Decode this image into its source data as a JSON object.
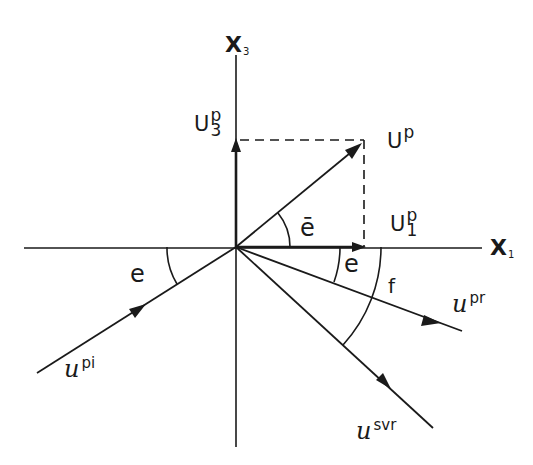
{
  "diagram": {
    "type": "vector-decomposition",
    "stroke_color": "#1a1a1a",
    "background": "#ffffff",
    "axes": {
      "horizontal": {
        "label": "X",
        "subscript": "1"
      },
      "vertical": {
        "label": "X",
        "subscript": "3"
      }
    },
    "vectors": {
      "up": {
        "label": "U",
        "superscript": "p"
      },
      "up1": {
        "label": "U",
        "superscript": "p",
        "subscript": "1"
      },
      "up3": {
        "label": "U",
        "superscript": "p",
        "subscript": "3"
      },
      "upi": {
        "label": "u",
        "superscript": "pi"
      },
      "upr": {
        "label": "u",
        "superscript": "pr"
      },
      "usvr": {
        "label": "u",
        "superscript": "svr"
      }
    },
    "angles": {
      "e_bar": "ē",
      "e_incident": "e",
      "e_reflected": "e",
      "f": "f"
    }
  }
}
